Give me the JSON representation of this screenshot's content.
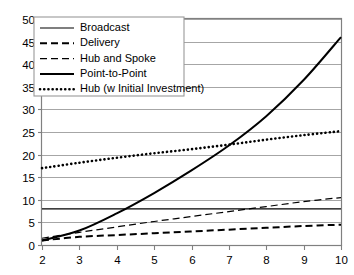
{
  "chart_data": {
    "type": "line",
    "title": "",
    "xlabel": "",
    "ylabel": "",
    "xlim": [
      2,
      10
    ],
    "ylim": [
      0,
      50
    ],
    "grid": true,
    "legend_position": "top-left",
    "x": [
      2,
      3,
      4,
      5,
      6,
      7,
      8,
      9,
      10
    ],
    "yticks": [
      "0",
      "5",
      "10",
      "15",
      "20",
      "25",
      "30",
      "35",
      "40",
      "45",
      "50"
    ],
    "xticks": [
      "2",
      "3",
      "4",
      "5",
      "6",
      "7",
      "8",
      "9",
      "10"
    ],
    "series": [
      {
        "name": "Broadcast",
        "style": "solid-thin",
        "values": [
          8,
          8,
          8,
          8,
          8,
          8,
          8,
          8,
          8
        ]
      },
      {
        "name": "Delivery",
        "style": "dashed-bold",
        "values": [
          1,
          1.8,
          2.2,
          2.6,
          3.0,
          3.4,
          3.8,
          4.2,
          4.5
        ]
      },
      {
        "name": "Hub and Spoke",
        "style": "dashed-thin",
        "values": [
          1.5,
          2.8,
          4.0,
          5.2,
          6.3,
          7.4,
          8.5,
          9.6,
          10.5
        ]
      },
      {
        "name": "Point-to-Point",
        "style": "solid-bold",
        "values": [
          1,
          3.2,
          7.0,
          11.5,
          16.5,
          22.0,
          28.5,
          36.5,
          46.0
        ]
      },
      {
        "name": "Hub (w Initial Investment)",
        "style": "dotted",
        "values": [
          17,
          18.2,
          19.3,
          20.3,
          21.2,
          22.2,
          23.3,
          24.3,
          25.2
        ]
      }
    ]
  },
  "legend": {
    "items": [
      {
        "label": "Broadcast"
      },
      {
        "label": "Delivery"
      },
      {
        "label": "Hub and Spoke"
      },
      {
        "label": "Point-to-Point"
      },
      {
        "label": "Hub (w Initial Investment)"
      }
    ]
  }
}
